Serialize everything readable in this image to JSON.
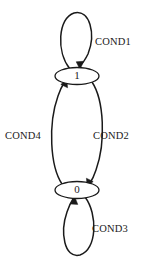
{
  "diagram": {
    "type": "state-transition-diagram",
    "title": "",
    "background_color": "#ffffff",
    "stroke_color": "#1a1a1a",
    "states": [
      {
        "id": "state-1",
        "label": "1",
        "cx": 77,
        "cy": 76,
        "rx": 22,
        "ry": 8.5
      },
      {
        "id": "state-0",
        "label": "0",
        "cx": 77,
        "cy": 190,
        "rx": 22,
        "ry": 8.5
      }
    ],
    "transitions": [
      {
        "id": "transition-cond1",
        "label": "COND1",
        "from": "state-1",
        "to": "state-1",
        "kind": "self-loop",
        "side": "top",
        "label_x": 95,
        "label_y": 43
      },
      {
        "id": "transition-cond2",
        "label": "COND2",
        "from": "state-1",
        "to": "state-0",
        "kind": "arc",
        "side": "right",
        "label_x": 93,
        "label_y": 137
      },
      {
        "id": "transition-cond3",
        "label": "COND3",
        "from": "state-0",
        "to": "state-0",
        "kind": "self-loop",
        "side": "bottom",
        "label_x": 92,
        "label_y": 230
      },
      {
        "id": "transition-cond4",
        "label": "COND4",
        "from": "state-0",
        "to": "state-1",
        "kind": "arc",
        "side": "left",
        "label_x": 5,
        "label_y": 137
      }
    ]
  }
}
